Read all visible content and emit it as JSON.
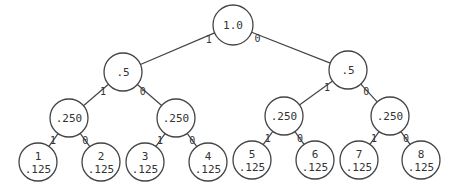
{
  "diagram": {
    "type": "binary-tree",
    "root": {
      "id": "n0",
      "value": "1.0",
      "x": 233,
      "y": 25,
      "r": 20
    },
    "nodes": [
      {
        "id": "n0",
        "value": "1.0",
        "x": 233,
        "y": 25,
        "r": 20
      },
      {
        "id": "n1",
        "value": ".5",
        "x": 123,
        "y": 72,
        "r": 19
      },
      {
        "id": "n2",
        "value": ".5",
        "x": 348,
        "y": 70,
        "r": 19
      },
      {
        "id": "n3",
        "value": ".250",
        "x": 69,
        "y": 118,
        "r": 19
      },
      {
        "id": "n4",
        "value": ".250",
        "x": 176,
        "y": 118,
        "r": 19
      },
      {
        "id": "n5",
        "value": ".250",
        "x": 284,
        "y": 116,
        "r": 19
      },
      {
        "id": "n6",
        "value": ".250",
        "x": 390,
        "y": 116,
        "r": 19
      },
      {
        "id": "l1",
        "label": "1",
        "value": ".125",
        "x": 38,
        "y": 162,
        "r": 19
      },
      {
        "id": "l2",
        "label": "2",
        "value": ".125",
        "x": 101,
        "y": 162,
        "r": 19
      },
      {
        "id": "l3",
        "label": "3",
        "value": ".125",
        "x": 145,
        "y": 162,
        "r": 19
      },
      {
        "id": "l4",
        "label": "4",
        "value": ".125",
        "x": 208,
        "y": 162,
        "r": 19
      },
      {
        "id": "l5",
        "label": "5",
        "value": ".125",
        "x": 252,
        "y": 160,
        "r": 19
      },
      {
        "id": "l6",
        "label": "6",
        "value": ".125",
        "x": 315,
        "y": 160,
        "r": 19
      },
      {
        "id": "l7",
        "label": "7",
        "value": ".125",
        "x": 359,
        "y": 160,
        "r": 19
      },
      {
        "id": "l8",
        "label": "8",
        "value": ".125",
        "x": 421,
        "y": 160,
        "r": 19
      }
    ],
    "edges": [
      {
        "from": "n0",
        "to": "n1",
        "bit": "1"
      },
      {
        "from": "n0",
        "to": "n2",
        "bit": "0"
      },
      {
        "from": "n1",
        "to": "n3",
        "bit": "1"
      },
      {
        "from": "n1",
        "to": "n4",
        "bit": "0"
      },
      {
        "from": "n2",
        "to": "n5",
        "bit": "1"
      },
      {
        "from": "n2",
        "to": "n6",
        "bit": "0"
      },
      {
        "from": "n3",
        "to": "l1",
        "bit": "1"
      },
      {
        "from": "n3",
        "to": "l2",
        "bit": "0"
      },
      {
        "from": "n4",
        "to": "l3",
        "bit": "1"
      },
      {
        "from": "n4",
        "to": "l4",
        "bit": "0"
      },
      {
        "from": "n5",
        "to": "l5",
        "bit": "1"
      },
      {
        "from": "n5",
        "to": "l6",
        "bit": "0"
      },
      {
        "from": "n6",
        "to": "l7",
        "bit": "1"
      },
      {
        "from": "n6",
        "to": "l8",
        "bit": "0"
      }
    ]
  },
  "text": {
    "root_value": "1.0",
    "level1_values": [
      ".5",
      ".5"
    ],
    "level2_values": [
      ".250",
      ".250",
      ".250",
      ".250"
    ],
    "leaf_labels": [
      "1",
      "2",
      "3",
      "4",
      "5",
      "6",
      "7",
      "8"
    ],
    "leaf_values": [
      ".125",
      ".125",
      ".125",
      ".125",
      ".125",
      ".125",
      ".125",
      ".125"
    ],
    "bit_one": "1",
    "bit_zero": "0"
  }
}
